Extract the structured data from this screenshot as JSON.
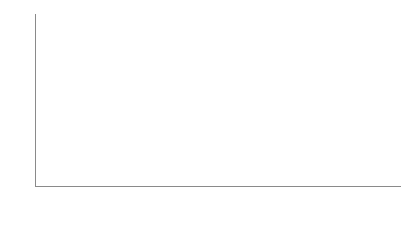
{
  "chart_data": {
    "type": "area",
    "title": "",
    "xlabel": "",
    "ylabel": "",
    "stacked": true,
    "grid": false,
    "legend_position": "top-left",
    "ylim": [
      0,
      210
    ],
    "yticks": [
      0,
      20,
      40,
      60,
      80,
      100,
      120,
      140,
      160,
      180,
      200
    ],
    "ytick_labels": [
      "0",
      "20",
      "40",
      "60",
      "80",
      "100",
      "120",
      "140",
      "160",
      "180",
      "200"
    ],
    "xticks": [
      "2014-01-01",
      "2014-02-01",
      "2014-03-01",
      "2014-04-01",
      "2014-05-01",
      "2014-06-01",
      "2014-07-01",
      "2014-08-01"
    ],
    "xtick_labels": [
      "2014-01-01",
      "2014-02-01",
      "2014-03-01",
      "2014-04-01",
      "2014-05-01",
      "2014-06-01",
      "2014-07-01",
      "2014-08-01"
    ],
    "xlim": [
      "2013-12-25",
      "2014-08-20"
    ],
    "x": [
      "2013-12-25",
      "2014-01-01",
      "2014-01-08",
      "2014-01-15",
      "2014-02-01",
      "2014-02-15",
      "2014-03-01",
      "2014-03-15",
      "2014-04-01",
      "2014-04-10",
      "2014-04-20",
      "2014-05-01",
      "2014-05-10",
      "2014-05-20",
      "2014-06-01",
      "2014-06-10",
      "2014-06-20",
      "2014-07-01",
      "2014-07-05",
      "2014-07-10",
      "2014-07-15",
      "2014-07-20",
      "2014-08-01",
      "2014-08-10",
      "2014-08-20"
    ],
    "series": [
      {
        "name": "Archived",
        "color": "#7a7a7a",
        "values": [
          0,
          6,
          7,
          7,
          7,
          7,
          7,
          7,
          7,
          22,
          38,
          52,
          62,
          70,
          74,
          74,
          74,
          76,
          78,
          80,
          86,
          92,
          98,
          100,
          100
        ]
      },
      {
        "name": "Deployed",
        "color": "#a8a8a8",
        "values": [
          0,
          1,
          1,
          1,
          1,
          1,
          1,
          1,
          1,
          2,
          3,
          4,
          5,
          6,
          8,
          8,
          8,
          12,
          14,
          16,
          18,
          20,
          26,
          30,
          30
        ]
      },
      {
        "name": "Review Queue",
        "color": "#cfcfcf",
        "values": [
          0,
          1,
          1,
          1,
          1,
          1,
          1,
          1,
          1,
          2,
          3,
          4,
          5,
          6,
          6,
          7,
          8,
          16,
          26,
          34,
          44,
          52,
          58,
          62,
          62
        ]
      },
      {
        "name": "Doing",
        "color": "#e8e8e8",
        "values": [
          0,
          0,
          0,
          0,
          0,
          0,
          0,
          0,
          0,
          0,
          0,
          0,
          0,
          0,
          0,
          1,
          2,
          4,
          6,
          7,
          8,
          9,
          10,
          10,
          10
        ]
      },
      {
        "name": "Analysis",
        "color": "#d6d6d6",
        "values": [
          0,
          0,
          0,
          0,
          0,
          0,
          0,
          0,
          0,
          0,
          0,
          0,
          0,
          0,
          0,
          0,
          0,
          1,
          1,
          1,
          1,
          1,
          1,
          1,
          1
        ]
      },
      {
        "name": "To Do",
        "color": "#262626",
        "values": [
          0,
          0,
          0,
          0,
          0,
          0,
          0,
          0,
          0,
          0,
          0,
          0,
          0,
          0,
          1,
          1,
          1,
          2,
          2,
          2,
          2,
          2,
          2,
          2,
          2
        ]
      }
    ],
    "totals_note": "Cumulative stacked totals rise from 0 to about 205."
  },
  "legend": {
    "items": [
      {
        "label": "To Do",
        "color": "#262626"
      },
      {
        "label": "Analysis",
        "color": "#d6d6d6"
      },
      {
        "label": "Doing",
        "color": "#e8e8e8"
      },
      {
        "label": "Review Queue",
        "color": "#cfcfcf"
      },
      {
        "label": "Deployed",
        "color": "#a8a8a8"
      },
      {
        "label": "Archived",
        "color": "#7a7a7a"
      }
    ]
  },
  "axis_colors": {
    "line": "#8a8a8a",
    "tick_text": "#4d4d4d",
    "outline": "#1a1a1a"
  }
}
